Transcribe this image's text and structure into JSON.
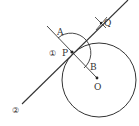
{
  "diagram": {
    "type": "geometric-construction",
    "labels": {
      "A": "A",
      "P": "P",
      "B": "B",
      "O": "O",
      "Q": "Q",
      "step1": "①",
      "step2": "②"
    },
    "colors": {
      "stroke": "#333333",
      "background": "#ffffff"
    }
  }
}
